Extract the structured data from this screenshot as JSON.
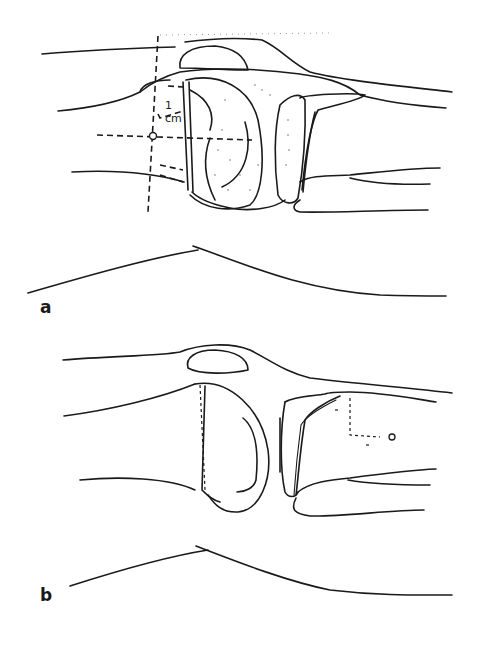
{
  "figure": {
    "panels": [
      {
        "id": "a",
        "label": "a",
        "annotation": {
          "value": "1",
          "unit": "cm"
        },
        "features": [
          "femur",
          "patella",
          "tibia",
          "fibula",
          "stippled femoral condyle",
          "dashed crosshair reference lines",
          "skin contour"
        ]
      },
      {
        "id": "b",
        "label": "b",
        "features": [
          "femur",
          "patella",
          "tibia",
          "fibula",
          "femoral condyle",
          "dashed offset marker",
          "skin contour"
        ]
      }
    ]
  },
  "colors": {
    "line": "#1a1a1a",
    "background": "#ffffff",
    "stipple": "#555555"
  }
}
